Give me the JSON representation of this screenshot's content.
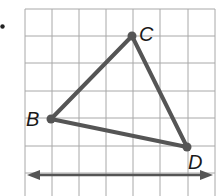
{
  "figure": {
    "bullet": "•",
    "grid": {
      "origin_x": 25,
      "origin_y": 9,
      "cell": 27.2,
      "cols": 7,
      "rows": 7,
      "color": "#a8a8a8"
    },
    "triangle": {
      "color": "#555555",
      "vertices": [
        {
          "label": "B",
          "x": 51,
          "y": 119
        },
        {
          "label": "C",
          "x": 132,
          "y": 36
        },
        {
          "label": "D",
          "x": 187,
          "y": 147
        }
      ]
    },
    "line": {
      "y": 175,
      "x1": 27,
      "x2": 213,
      "arrows": "both"
    },
    "labels": {
      "B": "B",
      "C": "C",
      "D": "D"
    }
  }
}
